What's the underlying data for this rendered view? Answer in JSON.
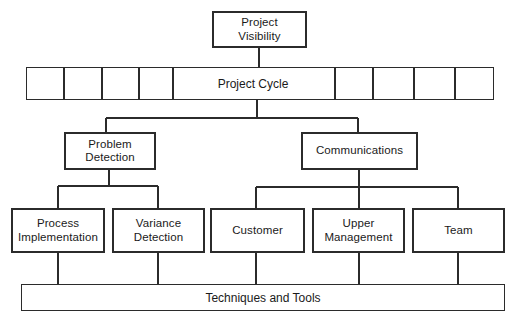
{
  "diagram": {
    "type": "org-chart",
    "line_color": "#2b2b2b",
    "background_color": "#ffffff",
    "box_fill": "#ffffff",
    "text_color": "#1a1a1a"
  },
  "nodes": {
    "root": {
      "label": "Project\nVisibility"
    },
    "cycle": {
      "label": "Project Cycle",
      "left_cells": 4,
      "right_cells": 5
    },
    "problem_detection": {
      "label": "Problem\nDetection"
    },
    "communications": {
      "label": "Communications"
    },
    "process_implementation": {
      "label": "Process\nImplementation"
    },
    "variance_detection": {
      "label": "Variance\nDetection"
    },
    "customer": {
      "label": "Customer"
    },
    "upper_management": {
      "label": "Upper\nManagement"
    },
    "team": {
      "label": "Team"
    },
    "techniques_and_tools": {
      "label": "Techniques and Tools"
    }
  },
  "edges": [
    {
      "from": "root",
      "to": "cycle"
    },
    {
      "from": "cycle",
      "to": "problem_detection"
    },
    {
      "from": "cycle",
      "to": "communications"
    },
    {
      "from": "problem_detection",
      "to": "process_implementation"
    },
    {
      "from": "problem_detection",
      "to": "variance_detection"
    },
    {
      "from": "communications",
      "to": "customer"
    },
    {
      "from": "communications",
      "to": "upper_management"
    },
    {
      "from": "communications",
      "to": "team"
    },
    {
      "from": "process_implementation",
      "to": "techniques_and_tools"
    },
    {
      "from": "variance_detection",
      "to": "techniques_and_tools"
    },
    {
      "from": "customer",
      "to": "techniques_and_tools"
    },
    {
      "from": "upper_management",
      "to": "techniques_and_tools"
    },
    {
      "from": "team",
      "to": "techniques_and_tools"
    }
  ]
}
